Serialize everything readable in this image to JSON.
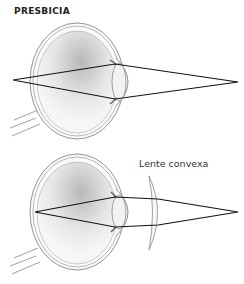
{
  "diagram": {
    "title": "PRESBICIA",
    "lens_label": "Lente convexa",
    "panels": [
      {
        "id": "uncorrected",
        "description": "Eye with presbyopia, focus point behind retina"
      },
      {
        "id": "corrected",
        "description": "Eye corrected with convex lens, focus on retina"
      }
    ],
    "colors": {
      "ray": "#111111",
      "outline": "#777777",
      "shade": "#bbbbbb"
    }
  }
}
